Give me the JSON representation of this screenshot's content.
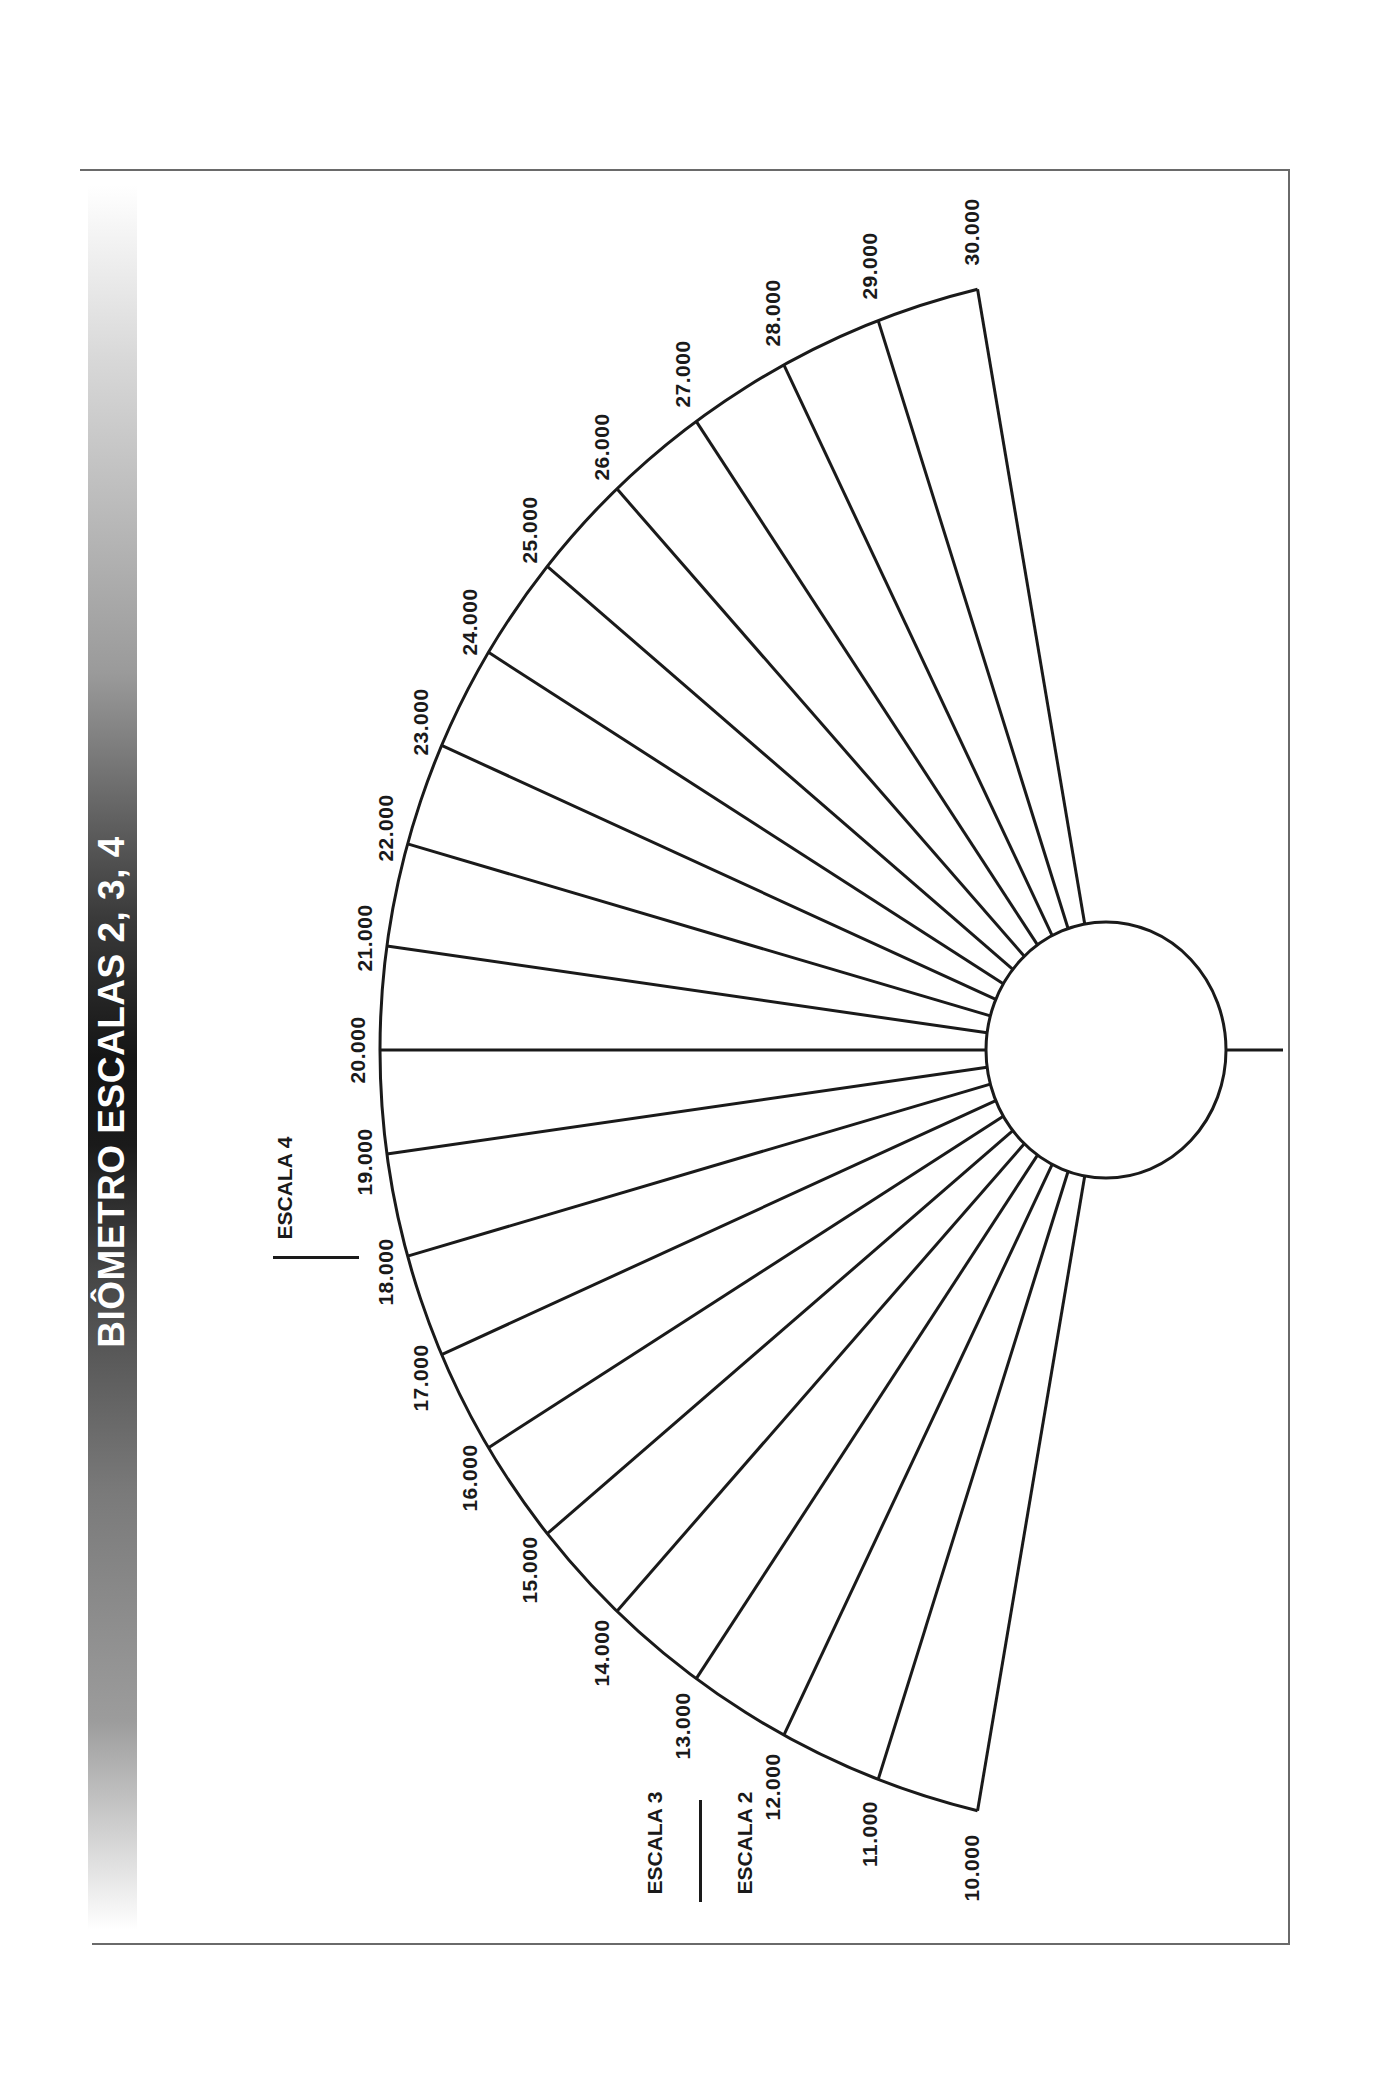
{
  "title": "BIÔMETRO ESCALAS 2, 3, 4",
  "legend": {
    "escala4": "ESCALA 4",
    "escala3": "ESCALA 3",
    "escala2": "ESCALA 2"
  },
  "colors": {
    "stroke": "#1a1a1a",
    "frame": "#6a6a6a",
    "title_text": "#ffffff"
  },
  "dial": {
    "arc_center": [
      1163,
      1050
    ],
    "arc_radius": 783,
    "start_angle_deg": 103.7,
    "end_angle_deg": 256.3,
    "hub_center": [
      1106,
      1050
    ],
    "hub_rx": 120,
    "hub_ry": 128,
    "stem_end_x": 1283
  },
  "chart_data": {
    "type": "table",
    "title": "BIÔMETRO ESCALAS 2, 3, 4",
    "scale_labels": [
      "10.000",
      "11.000",
      "12.000",
      "13.000",
      "14.000",
      "15.000",
      "16.000",
      "17.000",
      "18.000",
      "19.000",
      "20.000",
      "21.000",
      "22.000",
      "23.000",
      "24.000",
      "25.000",
      "26.000",
      "27.000",
      "28.000",
      "29.000",
      "30.000"
    ],
    "values": [
      10000,
      11000,
      12000,
      13000,
      14000,
      15000,
      16000,
      17000,
      18000,
      19000,
      20000,
      21000,
      22000,
      23000,
      24000,
      25000,
      26000,
      27000,
      28000,
      29000,
      30000
    ],
    "legend": [
      "ESCALA 4",
      "ESCALA 3",
      "ESCALA 2"
    ]
  }
}
